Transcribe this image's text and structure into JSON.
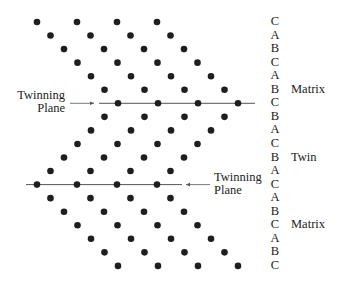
{
  "diagram": {
    "stacking_sequence": [
      "C",
      "A",
      "B",
      "C",
      "A",
      "B",
      "C",
      "B",
      "A",
      "C",
      "B",
      "A",
      "C",
      "A",
      "B",
      "C",
      "A",
      "B",
      "C"
    ],
    "row_start_x": [
      37,
      50.5,
      64,
      77.5,
      91,
      104.5,
      118,
      104.5,
      91,
      77.5,
      64,
      50.5,
      37,
      50.5,
      64,
      77.5,
      91,
      104.5,
      118
    ],
    "dots_per_row": 4,
    "dot_spacing": 40,
    "row_y0": 22,
    "row_spacing": 13.55,
    "regions": [
      {
        "label": "Matrix",
        "row": 5
      },
      {
        "label": "Twin",
        "row": 10
      },
      {
        "label": "Matrix",
        "row": 15
      }
    ],
    "twinning_planes": [
      {
        "row": 6,
        "label_line1": "Twinning",
        "label_line2": "Plane",
        "side": "left"
      },
      {
        "row": 12,
        "label_line1": "Twinning",
        "label_line2": "Plane",
        "side": "right"
      }
    ],
    "colors": {
      "dot": "#1e1e1e",
      "line": "#555555",
      "text": "#222222"
    }
  }
}
